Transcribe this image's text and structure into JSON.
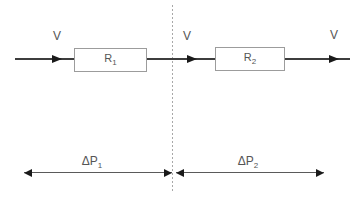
{
  "diagram": {
    "colors": {
      "background": "#ffffff",
      "wire": "#3d3d3d",
      "arrow": "#1a1a1a",
      "box_border": "#9c9c9c",
      "box_fill": "#ffffff",
      "dotted_divider": "#a8a8a8",
      "dimension_line": "#5a5a5a",
      "text": "#555555"
    },
    "flow_labels": {
      "left": "V",
      "middle": "V",
      "right": "V"
    },
    "resistors": [
      {
        "name": "R",
        "sub": "1"
      },
      {
        "name": "R",
        "sub": "2"
      }
    ],
    "pressure_drops": [
      {
        "name": "ΔP",
        "sub": "1"
      },
      {
        "name": "ΔP",
        "sub": "2"
      }
    ]
  }
}
